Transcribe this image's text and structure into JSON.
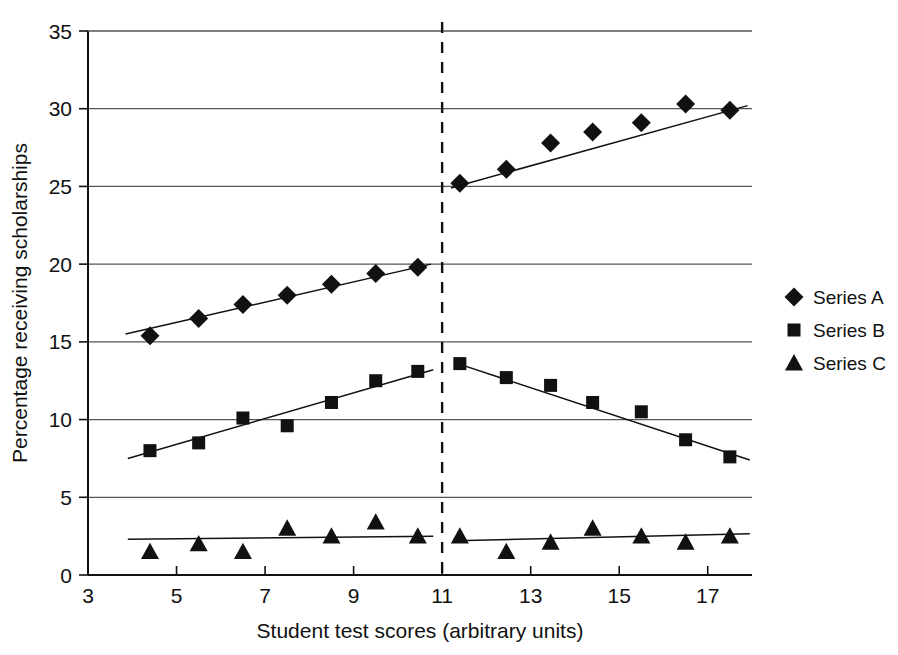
{
  "chart_data": {
    "type": "scatter",
    "title": "",
    "xlabel": "Student test scores (arbitrary units)",
    "ylabel": "Percentage receiving scholarships",
    "xlim": [
      3,
      18
    ],
    "ylim": [
      0,
      35
    ],
    "xticks": [
      3,
      5,
      7,
      9,
      11,
      13,
      15,
      17
    ],
    "yticks": [
      0,
      5,
      10,
      15,
      20,
      25,
      30,
      35
    ],
    "grid": "horizontal",
    "legend_position": "right",
    "annotations": [
      {
        "name": "discontinuity-line",
        "type": "vertical-dashed-line",
        "x": 11
      }
    ],
    "series": [
      {
        "name": "Series A",
        "marker": "diamond",
        "segments": [
          {
            "name": "left",
            "points": [
              {
                "x": 4.4,
                "y": 15.4
              },
              {
                "x": 5.5,
                "y": 16.5
              },
              {
                "x": 6.5,
                "y": 17.4
              },
              {
                "x": 7.5,
                "y": 18.0
              },
              {
                "x": 8.5,
                "y": 18.7
              },
              {
                "x": 9.5,
                "y": 19.4
              },
              {
                "x": 10.45,
                "y": 19.8
              }
            ],
            "trendline": {
              "x0": 3.85,
              "y0": 15.5,
              "x1": 10.75,
              "y1": 20.0
            }
          },
          {
            "name": "right",
            "points": [
              {
                "x": 11.4,
                "y": 25.2
              },
              {
                "x": 12.45,
                "y": 26.1
              },
              {
                "x": 13.45,
                "y": 27.8
              },
              {
                "x": 14.4,
                "y": 28.5
              },
              {
                "x": 15.5,
                "y": 29.1
              },
              {
                "x": 16.5,
                "y": 30.3
              },
              {
                "x": 17.5,
                "y": 29.9
              }
            ],
            "trendline": {
              "x0": 11.2,
              "y0": 24.9,
              "x1": 17.9,
              "y1": 30.2
            }
          }
        ]
      },
      {
        "name": "Series B",
        "marker": "square",
        "segments": [
          {
            "name": "left",
            "points": [
              {
                "x": 4.4,
                "y": 8.0
              },
              {
                "x": 5.5,
                "y": 8.5
              },
              {
                "x": 6.5,
                "y": 10.1
              },
              {
                "x": 7.5,
                "y": 9.6
              },
              {
                "x": 8.5,
                "y": 11.1
              },
              {
                "x": 9.5,
                "y": 12.5
              },
              {
                "x": 10.45,
                "y": 13.1
              }
            ],
            "trendline": {
              "x0": 3.9,
              "y0": 7.5,
              "x1": 10.8,
              "y1": 13.2
            }
          },
          {
            "name": "right",
            "points": [
              {
                "x": 11.4,
                "y": 13.6
              },
              {
                "x": 12.45,
                "y": 12.7
              },
              {
                "x": 13.45,
                "y": 12.2
              },
              {
                "x": 14.4,
                "y": 11.1
              },
              {
                "x": 15.5,
                "y": 10.5
              },
              {
                "x": 16.5,
                "y": 8.7
              },
              {
                "x": 17.5,
                "y": 7.6
              }
            ],
            "trendline": {
              "x0": 11.35,
              "y0": 13.6,
              "x1": 17.95,
              "y1": 7.4
            }
          }
        ]
      },
      {
        "name": "Series C",
        "marker": "triangle",
        "segments": [
          {
            "name": "left",
            "points": [
              {
                "x": 4.4,
                "y": 1.5
              },
              {
                "x": 5.5,
                "y": 2.0
              },
              {
                "x": 6.5,
                "y": 1.5
              },
              {
                "x": 7.5,
                "y": 3.0
              },
              {
                "x": 8.5,
                "y": 2.5
              },
              {
                "x": 9.5,
                "y": 3.4
              },
              {
                "x": 10.45,
                "y": 2.5
              }
            ],
            "trendline": {
              "x0": 3.9,
              "y0": 2.3,
              "x1": 10.8,
              "y1": 2.5
            }
          },
          {
            "name": "right",
            "points": [
              {
                "x": 11.4,
                "y": 2.5
              },
              {
                "x": 12.45,
                "y": 1.5
              },
              {
                "x": 13.45,
                "y": 2.1
              },
              {
                "x": 14.4,
                "y": 3.0
              },
              {
                "x": 15.5,
                "y": 2.5
              },
              {
                "x": 16.5,
                "y": 2.1
              },
              {
                "x": 17.5,
                "y": 2.5
              }
            ],
            "trendline": {
              "x0": 11.3,
              "y0": 2.2,
              "x1": 17.95,
              "y1": 2.65
            }
          }
        ]
      }
    ]
  },
  "legend": {
    "items": [
      {
        "label": "Series A",
        "marker": "diamond"
      },
      {
        "label": "Series B",
        "marker": "square"
      },
      {
        "label": "Series C",
        "marker": "triangle"
      }
    ]
  },
  "colors": {
    "ink": "#111111",
    "grid": "#555555",
    "background": "#ffffff"
  }
}
